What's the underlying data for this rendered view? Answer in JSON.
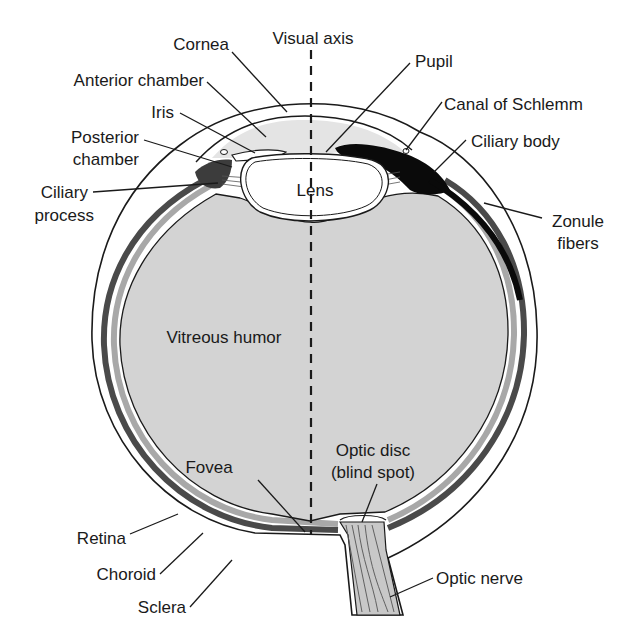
{
  "diagram": {
    "colors": {
      "background": "#ffffff",
      "vitreous": "#d3d3d3",
      "choroid": "#555555",
      "retina": "#a8a8a8",
      "ciliary_body": "#0a0a0a",
      "line": "#1a1a1a"
    },
    "labels": {
      "cornea": "Cornea",
      "visual_axis": "Visual axis",
      "pupil": "Pupil",
      "anterior_chamber": "Anterior chamber",
      "canal_of_schlemm": "Canal of Schlemm",
      "iris": "Iris",
      "ciliary_body": "Ciliary body",
      "posterior_chamber_1": "Posterior",
      "posterior_chamber_2": "chamber",
      "lens": "Lens",
      "ciliary_process_1": "Ciliary",
      "ciliary_process_2": "process",
      "zonule_fibers_1": "Zonule",
      "zonule_fibers_2": "fibers",
      "vitreous_humor": "Vitreous humor",
      "optic_disc_1": "Optic disc",
      "optic_disc_2": "(blind spot)",
      "fovea": "Fovea",
      "retina": "Retina",
      "choroid": "Choroid",
      "optic_nerve": "Optic nerve",
      "sclera": "Sclera"
    }
  }
}
